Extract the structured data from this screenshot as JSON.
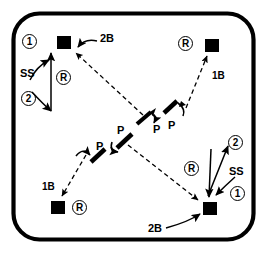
{
  "diagram": {
    "field": {
      "shape": "rounded-rectangle",
      "stroke_color": "#000000",
      "fill_color": "#ffffff",
      "stroke_width": 4
    },
    "bases": [
      {
        "name": "base-top-left",
        "label": "2B",
        "x": 63,
        "y": 42,
        "color": "#000000"
      },
      {
        "name": "base-top-right",
        "label": "1B",
        "x": 211,
        "y": 45,
        "color": "#000000"
      },
      {
        "name": "base-bottom-left",
        "label": "1B",
        "x": 57,
        "y": 207,
        "color": "#000000"
      },
      {
        "name": "base-bottom-right",
        "label": "2B",
        "x": 209,
        "y": 208,
        "color": "#000000"
      }
    ],
    "base_labels": {
      "top_left": "2B",
      "top_right": "1B",
      "bottom_left": "1B",
      "bottom_right": "2B"
    },
    "position_labels": {
      "pitcher": "P",
      "shortstop": "SS",
      "runner": "R"
    },
    "sequence_markers": {
      "first": "1",
      "second": "2",
      "runner": "R"
    },
    "upper_left_group": {
      "step_one": "1",
      "step_two": "2",
      "fielder": "SS",
      "runner": "R"
    },
    "upper_right_group": {
      "runner": "R",
      "base": "1B",
      "pitcher": "P"
    },
    "lower_left_group": {
      "pitcher": "P",
      "base": "1B",
      "runner": "R"
    },
    "lower_right_group": {
      "step_one": "1",
      "step_two": "2",
      "fielder": "SS",
      "runner": "R",
      "base": "2B"
    },
    "center_group": {
      "pitcher_upper": "P",
      "pitcher_mid": "P",
      "pitcher_left": "P"
    },
    "line_styles": {
      "throw": "dashed",
      "movement": "solid"
    }
  }
}
